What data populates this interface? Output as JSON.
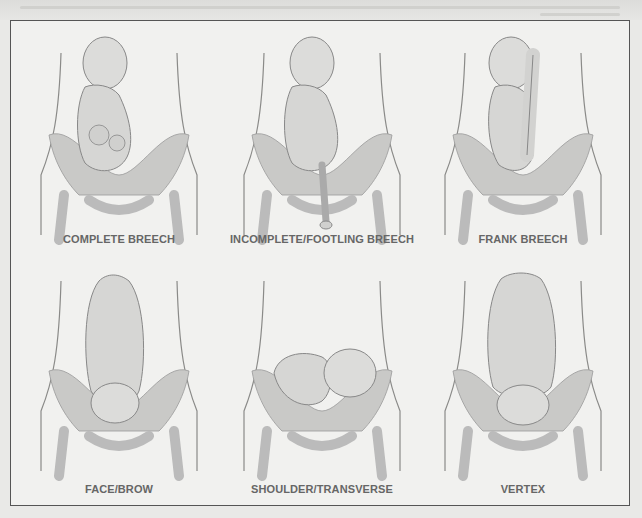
{
  "figure": {
    "panels": [
      {
        "id": "complete-breech",
        "label": "COMPLETE BREECH",
        "pose": "breech-complete"
      },
      {
        "id": "incomplete-footling-breech",
        "label": "INCOMPLETE/FOOTLING BREECH",
        "pose": "breech-footling"
      },
      {
        "id": "frank-breech",
        "label": "FRANK BREECH",
        "pose": "breech-frank"
      },
      {
        "id": "face-brow",
        "label": "FACE/BROW",
        "pose": "face"
      },
      {
        "id": "shoulder-transverse",
        "label": "SHOULDER/TRANSVERSE",
        "pose": "transverse"
      },
      {
        "id": "vertex",
        "label": "VERTEX",
        "pose": "vertex"
      }
    ]
  },
  "colors": {
    "frame_border": "#555555",
    "label_text": "#666666",
    "pelvis_fill": "#c9c9c7",
    "body_outline": "#8a8a88",
    "fetus_fill": "#d8d8d6"
  }
}
